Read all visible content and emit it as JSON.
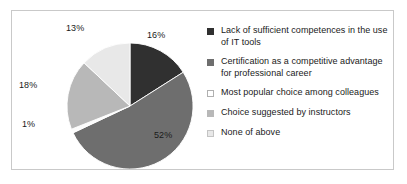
{
  "chart_data": {
    "type": "pie",
    "title": "",
    "subtitle": "",
    "xlabel": "",
    "ylabel": "",
    "grid": false,
    "legend_position": "right",
    "start_angle_deg": 0,
    "direction": "clockwise",
    "categories": [
      "Lack of sufficient competences in the use of IT tools",
      "Certification as a competitive advantage for professional career",
      "Most popular choice among colleagues",
      "Choice suggested by instructors",
      "None of above"
    ],
    "values": [
      16,
      52,
      1,
      18,
      13
    ],
    "value_unit": "%",
    "data_labels": [
      "16%",
      "52%",
      "1%",
      "18%",
      "13%"
    ],
    "slice_colors": [
      "#303030",
      "#6e6e6e",
      "#fcfcfc",
      "#b8b8b8",
      "#e8e8e8"
    ],
    "slices": [
      {
        "label": "Lack of sufficient competences in the use of IT tools",
        "value": 16,
        "display": "16%",
        "color": "#303030"
      },
      {
        "label": "Certification as a competitive advantage for professional career",
        "value": 52,
        "display": "52%",
        "color": "#6e6e6e"
      },
      {
        "label": "Most popular choice among colleagues",
        "value": 1,
        "display": "1%",
        "color": "#fcfcfc"
      },
      {
        "label": "Choice suggested by instructors",
        "value": 18,
        "display": "18%",
        "color": "#b8b8b8"
      },
      {
        "label": "None of above",
        "value": 13,
        "display": "13%",
        "color": "#e8e8e8"
      }
    ]
  },
  "labels": {
    "pct_16": "16%",
    "pct_52": "52%",
    "pct_1": "1%",
    "pct_18": "18%",
    "pct_13": "13%"
  },
  "legend": {
    "items": [
      {
        "label": "Lack of sufficient competences in the use of IT tools",
        "color": "#303030",
        "border": "#303030"
      },
      {
        "label": "Certification as a competitive advantage for professional career",
        "color": "#6e6e6e",
        "border": "#6e6e6e"
      },
      {
        "label": "Most popular choice among colleagues",
        "color": "#ffffff",
        "border": "#b0b0b0"
      },
      {
        "label": "Choice suggested by instructors",
        "color": "#b8b8b8",
        "border": "#b8b8b8"
      },
      {
        "label": "None of above",
        "color": "#e8e8e8",
        "border": "#c4c4c4"
      }
    ]
  },
  "style": {
    "frame_border_color": "#c9c9c9",
    "background": "#ffffff",
    "slice_outline": "#ffffff"
  }
}
